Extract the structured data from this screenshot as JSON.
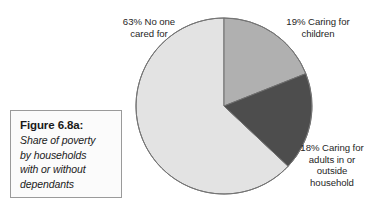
{
  "figure": {
    "caption_title": "Figure 6.8a:",
    "caption_lines": [
      "Share of poverty",
      "by households",
      "with or without",
      "dependants"
    ]
  },
  "labels": {
    "no_one_cared_for": [
      "63% No one",
      "cared for"
    ],
    "caring_for_children": [
      "19% Caring for",
      "children"
    ],
    "caring_for_adults": [
      "18% Caring for",
      "adults in or",
      "outside",
      "household"
    ]
  },
  "chart_data": {
    "type": "pie",
    "title": "Figure 6.8a: Share of poverty by households with or without dependants",
    "categories": [
      "Caring for children",
      "Caring for adults in or outside household",
      "No one cared for"
    ],
    "values": [
      19,
      18,
      63
    ],
    "value_unit": "percent",
    "labels": [
      "19% Caring for children",
      "18% Caring for adults in or outside household",
      "63% No one cared for"
    ],
    "colors": [
      "#b0b0b0",
      "#4d4d4d",
      "#e3e3e3"
    ],
    "start_angle_deg": 0,
    "direction": "clockwise",
    "legend": "none",
    "grid": false,
    "geometry": {
      "center_x": 90,
      "center_y": 90,
      "radius": 88,
      "stroke": "#6f6f6f",
      "stroke_width": 1
    },
    "slice_paths": [
      {
        "name": "Caring for children",
        "value": 19,
        "start_deg": 0,
        "end_deg": 68.4,
        "color": "#b0b0b0",
        "d": "M 90 90 L 90 2 A 88 88 0 0 1 171.82 58.38 Z"
      },
      {
        "name": "Caring for adults in or outside household",
        "value": 18,
        "start_deg": 68.4,
        "end_deg": 133.2,
        "color": "#4d4d4d",
        "d": "M 90 90 L 171.82 58.38 A 88 88 0 0 1 154.20 154.20 Z"
      },
      {
        "name": "No one cared for",
        "value": 63,
        "start_deg": 133.2,
        "end_deg": 360,
        "color": "#e3e3e3",
        "d": "M 90 90 L 154.20 154.20 A 88 88 0 1 1 90 2 Z"
      }
    ]
  }
}
